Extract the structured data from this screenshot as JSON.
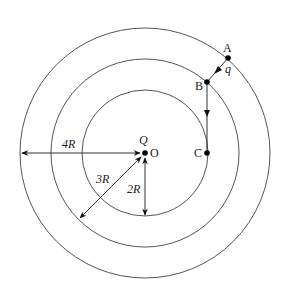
{
  "diagram": {
    "type": "concentric-circles-electrostatics",
    "center": {
      "label": "O",
      "charge_label": "Q"
    },
    "circles": [
      {
        "name": "inner",
        "radius_label": "2R"
      },
      {
        "name": "middle",
        "radius_label": "3R"
      },
      {
        "name": "outer",
        "radius_label": "4R"
      }
    ],
    "points": [
      {
        "label": "A"
      },
      {
        "label": "B"
      },
      {
        "label": "C"
      }
    ],
    "test_charge_label": "q",
    "dimension_labels": {
      "r4": "4R",
      "r3": "3R",
      "r2": "2R"
    },
    "colors": {
      "line": "#555555",
      "point": "#000000",
      "text": "#222222"
    }
  }
}
